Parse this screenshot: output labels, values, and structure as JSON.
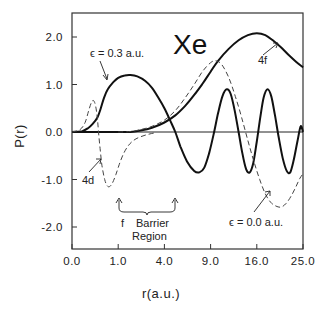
{
  "chart_data": {
    "type": "line",
    "title": "Xe",
    "xlabel": "r(a.u.)",
    "ylabel": "P(r)",
    "x_scale": "sqrt",
    "xlim": [
      0.0,
      25.0
    ],
    "ylim": [
      -2.5,
      2.5
    ],
    "x_ticks": [
      "0.0",
      "1.0",
      "4.0",
      "9.0",
      "16.0",
      "25.0"
    ],
    "x_tick_values": [
      0,
      1,
      4,
      9,
      16,
      25
    ],
    "y_ticks": [
      "2.0",
      "1.0",
      "0.0",
      "-1.0",
      "-2.0"
    ],
    "y_tick_values": [
      2,
      1,
      0,
      -1,
      -2
    ],
    "grid": false,
    "legend": null,
    "series": [
      {
        "name": "4f",
        "style": "solid",
        "points": [
          [
            0,
            0
          ],
          [
            1.0,
            0
          ],
          [
            1.6,
            0.0
          ],
          [
            2.2,
            0.03
          ],
          [
            3.0,
            0.09
          ],
          [
            4.0,
            0.2
          ],
          [
            5.0,
            0.35
          ],
          [
            6.0,
            0.55
          ],
          [
            7.0,
            0.78
          ],
          [
            8.0,
            1.02
          ],
          [
            9.0,
            1.27
          ],
          [
            10.0,
            1.5
          ],
          [
            11.5,
            1.75
          ],
          [
            13.0,
            1.93
          ],
          [
            14.5,
            2.04
          ],
          [
            16.0,
            2.08
          ],
          [
            17.5,
            2.04
          ],
          [
            19.0,
            1.92
          ],
          [
            20.5,
            1.78
          ],
          [
            22.0,
            1.62
          ],
          [
            23.5,
            1.48
          ],
          [
            25.0,
            1.36
          ]
        ]
      },
      {
        "name": "ε = 0.3 a.u.",
        "style": "solid",
        "points": [
          [
            0,
            0
          ],
          [
            0.05,
            0.02
          ],
          [
            0.12,
            0.08
          ],
          [
            0.2,
            0.17
          ],
          [
            0.3,
            0.3
          ],
          [
            0.38,
            0.48
          ],
          [
            0.48,
            0.72
          ],
          [
            0.6,
            0.9
          ],
          [
            0.8,
            1.05
          ],
          [
            1.0,
            1.14
          ],
          [
            1.3,
            1.19
          ],
          [
            1.6,
            1.2
          ],
          [
            2.0,
            1.17
          ],
          [
            2.5,
            1.08
          ],
          [
            3.0,
            0.93
          ],
          [
            3.5,
            0.72
          ],
          [
            4.0,
            0.5
          ],
          [
            4.5,
            0.25
          ],
          [
            5.0,
            0.0
          ],
          [
            5.5,
            -0.3
          ],
          [
            6.2,
            -0.62
          ],
          [
            7.0,
            -0.82
          ],
          [
            7.6,
            -0.85
          ],
          [
            8.2,
            -0.75
          ],
          [
            8.8,
            -0.45
          ],
          [
            9.4,
            -0.05
          ],
          [
            10.0,
            0.4
          ],
          [
            10.6,
            0.75
          ],
          [
            11.2,
            0.9
          ],
          [
            11.8,
            0.8
          ],
          [
            12.4,
            0.45
          ],
          [
            13.0,
            0.0
          ],
          [
            13.6,
            -0.45
          ],
          [
            14.2,
            -0.78
          ],
          [
            14.8,
            -0.85
          ],
          [
            15.4,
            -0.65
          ],
          [
            16.0,
            -0.2
          ],
          [
            16.6,
            0.3
          ],
          [
            17.2,
            0.72
          ],
          [
            17.9,
            0.9
          ],
          [
            18.6,
            0.75
          ],
          [
            19.3,
            0.35
          ],
          [
            20.0,
            -0.1
          ],
          [
            20.8,
            -0.55
          ],
          [
            21.6,
            -0.82
          ],
          [
            22.3,
            -0.85
          ],
          [
            23.0,
            -0.6
          ],
          [
            23.8,
            -0.2
          ],
          [
            24.5,
            0.12
          ],
          [
            25.0,
            0.0
          ]
        ]
      },
      {
        "name": "4d",
        "style": "dashed",
        "points": [
          [
            0,
            0
          ],
          [
            0.03,
            0.05
          ],
          [
            0.08,
            0.2
          ],
          [
            0.13,
            0.45
          ],
          [
            0.18,
            0.63
          ],
          [
            0.22,
            0.66
          ],
          [
            0.26,
            0.55
          ],
          [
            0.3,
            0.3
          ],
          [
            0.33,
            0.0
          ],
          [
            0.37,
            -0.35
          ],
          [
            0.42,
            -0.7
          ],
          [
            0.5,
            -1.0
          ],
          [
            0.58,
            -1.13
          ],
          [
            0.66,
            -1.15
          ],
          [
            0.76,
            -1.08
          ],
          [
            0.9,
            -0.9
          ],
          [
            1.05,
            -0.68
          ],
          [
            1.25,
            -0.45
          ],
          [
            1.5,
            -0.28
          ],
          [
            1.8,
            -0.17
          ],
          [
            2.2,
            -0.1
          ],
          [
            2.7,
            -0.05
          ],
          [
            3.2,
            -0.02
          ]
        ]
      },
      {
        "name": "ε = 0.0 a.u.",
        "style": "dashed",
        "points": [
          [
            1.0,
            0.0
          ],
          [
            1.6,
            0.01
          ],
          [
            2.2,
            0.05
          ],
          [
            3.0,
            0.12
          ],
          [
            4.0,
            0.25
          ],
          [
            5.0,
            0.45
          ],
          [
            6.0,
            0.72
          ],
          [
            7.0,
            1.0
          ],
          [
            8.0,
            1.28
          ],
          [
            9.0,
            1.46
          ],
          [
            9.7,
            1.5
          ],
          [
            10.5,
            1.42
          ],
          [
            11.5,
            1.15
          ],
          [
            12.5,
            0.75
          ],
          [
            13.5,
            0.3
          ],
          [
            14.5,
            -0.18
          ],
          [
            15.5,
            -0.62
          ],
          [
            16.5,
            -1.0
          ],
          [
            17.5,
            -1.3
          ],
          [
            18.5,
            -1.48
          ],
          [
            19.5,
            -1.56
          ],
          [
            20.5,
            -1.58
          ],
          [
            21.5,
            -1.5
          ],
          [
            22.5,
            -1.35
          ],
          [
            23.5,
            -1.15
          ],
          [
            24.3,
            -0.98
          ],
          [
            25.0,
            -0.88
          ]
        ]
      }
    ],
    "annotations": [
      {
        "text": "ε = 0.3 a.u.",
        "arrow_to_series": "ε = 0.3 a.u."
      },
      {
        "text": "4f",
        "arrow_to_series": "4f"
      },
      {
        "text": "4d",
        "arrow_to_series": "4d"
      },
      {
        "text": "ε = 0.0 a.u.",
        "arrow_to_series": "ε = 0.0 a.u."
      },
      {
        "text": "f   Barrier Region",
        "span_r": [
          1.0,
          4.8
        ]
      }
    ]
  },
  "labels": {
    "title": "Xe",
    "xlabel": "r(a.u.)",
    "ylabel": "P(r)",
    "eps03": "ϵ = 0.3 a.u.",
    "eps00": "ϵ = 0.0 a.u.",
    "lab4f": "4f",
    "lab4d": "4d",
    "barrier_f": "f",
    "barrier_line1": "Barrier",
    "barrier_line2": "Region"
  }
}
